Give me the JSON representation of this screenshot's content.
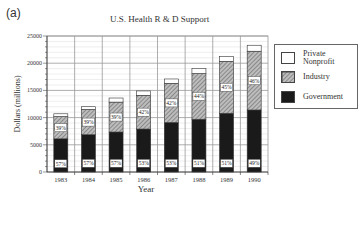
{
  "panel_label": "(a)",
  "chart_data": {
    "type": "bar",
    "stacked": true,
    "title": "U.S. Health R & D Support",
    "xlabel": "Year",
    "ylabel": "Dollars (millions)",
    "ylim": [
      0,
      25000
    ],
    "yticks": [
      0,
      5000,
      10000,
      15000,
      20000,
      25000
    ],
    "grid": true,
    "legend_position": "right",
    "categories": [
      "1983",
      "1984",
      "1985",
      "1986",
      "1987",
      "1988",
      "1989",
      "1990"
    ],
    "series": [
      {
        "name": "Government",
        "pattern": "solid-black",
        "values": [
          6100,
          6850,
          7350,
          7900,
          9100,
          9700,
          10800,
          11400
        ],
        "labels": [
          "57%",
          "57%",
          "57%",
          "53%",
          "53%",
          "51%",
          "51%",
          "49%"
        ]
      },
      {
        "name": "Industry",
        "pattern": "hatched",
        "values": [
          4100,
          4650,
          5500,
          6200,
          7200,
          8400,
          9550,
          10800
        ],
        "labels": [
          "39%",
          "39%",
          "39%",
          "42%",
          "42%",
          "44%",
          "45%",
          "46%"
        ]
      },
      {
        "name": "Private Nonprofit",
        "pattern": "white",
        "values": [
          500,
          500,
          750,
          800,
          800,
          900,
          850,
          1100
        ]
      }
    ],
    "totals": [
      10700,
      12000,
      13600,
      14900,
      17100,
      19000,
      21200,
      23300
    ]
  },
  "legend": {
    "items": [
      {
        "label_line1": "Private",
        "label_line2": "Nonprofit"
      },
      {
        "label_line1": "Industry",
        "label_line2": ""
      },
      {
        "label_line1": "Government",
        "label_line2": ""
      }
    ]
  }
}
